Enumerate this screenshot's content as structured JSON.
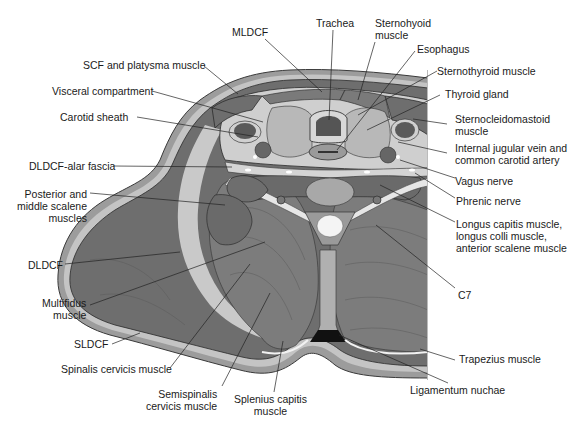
{
  "figure": {
    "colors": {
      "muscle_dark": "#6b6b6b",
      "muscle_mid": "#8a8a8a",
      "fascia_light": "#c8c8c8",
      "skin": "#9a9a9a",
      "visceral": "#b4b4b4",
      "bone": "#eeeeee",
      "line": "#222222"
    }
  },
  "labels": {
    "mldcf": "MLDCF",
    "trachea": "Trachea",
    "sternohyoid": [
      "Sternohyoid",
      "muscle"
    ],
    "esophagus": "Esophagus",
    "sternothyroid": "Sternothyroid muscle",
    "thyroid": "Thyroid gland",
    "scm": [
      "Sternocleidomastoid",
      "muscle"
    ],
    "ijv": [
      "Internal jugular vein and",
      "common carotid artery"
    ],
    "vagus": "Vagus nerve",
    "phrenic": "Phrenic nerve",
    "longus": [
      "Longus capitis muscle,",
      "longus colli muscle,",
      "anterior scalene muscle"
    ],
    "c7": "C7",
    "trapezius": "Trapezius muscle",
    "ligamentum": "Ligamentum nuchae",
    "splenius": [
      "Splenius capitis",
      "muscle"
    ],
    "semispinalis": [
      "Semispinalis",
      "cervicis muscle"
    ],
    "spinalis": "Spinalis cervicis muscle",
    "sldcf": "SLDCF",
    "multifidus": [
      "Multifidus",
      "muscle"
    ],
    "dldcf": "DLDCF",
    "scalene": [
      "Posterior and",
      "middle scalene",
      "muscles"
    ],
    "alar": "DLDCF-alar fascia",
    "carotid_sheath": "Carotid sheath",
    "visceral": "Visceral compartment",
    "scf": "SCF and platysma muscle"
  }
}
